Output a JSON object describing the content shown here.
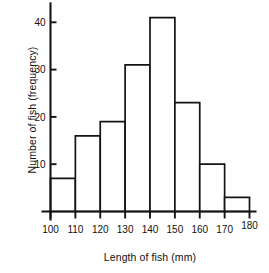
{
  "chart_data": {
    "type": "bar",
    "title": "",
    "subtitle": "",
    "xlabel": "Length of fish (mm)",
    "ylabel": "Number of fish (frequency)",
    "bin_edges": [
      100,
      110,
      120,
      130,
      140,
      150,
      160,
      170,
      180
    ],
    "categories": [
      "100-110",
      "110-120",
      "120-130",
      "130-140",
      "140-150",
      "150-160",
      "160-170",
      "170-180"
    ],
    "values": [
      7,
      16,
      19,
      31,
      41,
      23,
      10,
      3
    ],
    "xlim": [
      100,
      180
    ],
    "ylim": [
      0,
      44
    ],
    "xticks": [
      100,
      110,
      120,
      130,
      140,
      150,
      160,
      170,
      180
    ],
    "xtick_labels": [
      "100",
      "110",
      "120",
      "130",
      "140",
      "150",
      "160",
      "170",
      "180"
    ],
    "yticks": [
      10,
      20,
      30,
      40
    ],
    "ytick_labels": [
      "10",
      "20",
      "30",
      "40"
    ],
    "grid": false,
    "legend": null,
    "bar_fill": "#ffffff",
    "bar_stroke": "#141414",
    "axis_color": "#141414",
    "background": "#ffffff"
  }
}
